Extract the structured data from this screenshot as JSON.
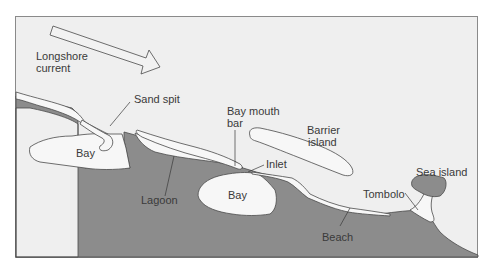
{
  "diagram": {
    "colors": {
      "background": "#ffffff",
      "sea": "#efefef",
      "land": "#8c8c8c",
      "sand": "#f7f7f7",
      "outline": "#4a4a4a",
      "text": "#3a3a3a",
      "frame": "#8a8a8a"
    },
    "arrow": {
      "label_line1": "Longshore",
      "label_line2": "current",
      "direction": "right-down (southeast)"
    },
    "labels": {
      "sand_spit": "Sand spit",
      "bay_left": "Bay",
      "lagoon": "Lagoon",
      "bay_mouth_bar_line1": "Bay mouth",
      "bay_mouth_bar_line2": "bar",
      "inlet": "Inlet",
      "bay_center": "Bay",
      "barrier_island_line1": "Barrier",
      "barrier_island_line2": "island",
      "beach": "Beach",
      "tombolo": "Tombolo",
      "sea_island": "Sea island"
    }
  }
}
